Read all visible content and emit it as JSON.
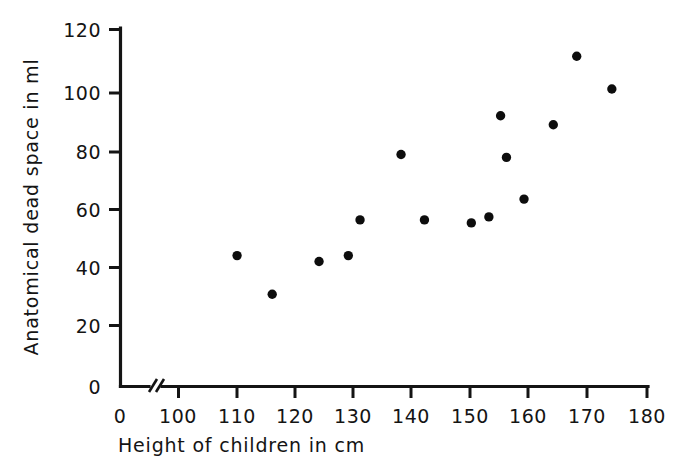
{
  "figure": {
    "background_color": "#ffffff",
    "ink_color": "#141414",
    "point_color": "#0d0d0d"
  },
  "chart_data": {
    "type": "scatter",
    "title": "",
    "xlabel": "Height of children in cm",
    "ylabel": "Anatomical dead space in ml",
    "xlim": [
      100,
      180
    ],
    "ylim": [
      0,
      120
    ],
    "x_axis_break": true,
    "x_origin_label": "0",
    "y_origin_label": "0",
    "grid": false,
    "legend": null,
    "xticks": [
      100,
      110,
      120,
      130,
      140,
      150,
      160,
      170,
      180
    ],
    "xtick_labels": [
      "100",
      "110",
      "120",
      "130",
      "140",
      "150",
      "160",
      "170",
      "180"
    ],
    "yticks": [
      0,
      20,
      40,
      60,
      80,
      100,
      120
    ],
    "ytick_labels": [
      "0",
      "20",
      "40",
      "60",
      "80",
      "100",
      "120"
    ],
    "marker": "filled-circle",
    "marker_size": 6,
    "x": [
      110,
      116,
      124,
      129,
      131,
      138,
      142,
      150,
      153,
      155,
      156,
      159,
      164,
      168,
      174
    ],
    "y": [
      44,
      31,
      42,
      44,
      56,
      78,
      56,
      55,
      57,
      91,
      77,
      63,
      88,
      111,
      100
    ],
    "points": [
      {
        "height_cm": 110,
        "dead_space_ml": 44
      },
      {
        "height_cm": 116,
        "dead_space_ml": 31
      },
      {
        "height_cm": 124,
        "dead_space_ml": 42
      },
      {
        "height_cm": 129,
        "dead_space_ml": 44
      },
      {
        "height_cm": 131,
        "dead_space_ml": 56
      },
      {
        "height_cm": 138,
        "dead_space_ml": 78
      },
      {
        "height_cm": 142,
        "dead_space_ml": 56
      },
      {
        "height_cm": 150,
        "dead_space_ml": 55
      },
      {
        "height_cm": 153,
        "dead_space_ml": 57
      },
      {
        "height_cm": 155,
        "dead_space_ml": 91
      },
      {
        "height_cm": 156,
        "dead_space_ml": 77
      },
      {
        "height_cm": 159,
        "dead_space_ml": 63
      },
      {
        "height_cm": 164,
        "dead_space_ml": 88
      },
      {
        "height_cm": 168,
        "dead_space_ml": 111
      },
      {
        "height_cm": 174,
        "dead_space_ml": 100
      }
    ]
  }
}
